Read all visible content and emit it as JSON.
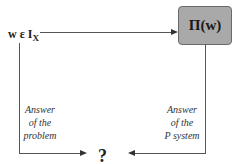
{
  "diagram": {
    "input": {
      "main": "w ε I",
      "sub": "X"
    },
    "box": {
      "label": "Π(w)"
    },
    "left_edge": {
      "lines": [
        "Answer",
        "of the",
        "problem"
      ]
    },
    "right_edge": {
      "lines": [
        "Answer",
        "of the",
        "P system"
      ]
    },
    "result": {
      "label": "?"
    }
  },
  "colors": {
    "box_fill": "#a9a9a9",
    "box_border": "#6a6a6a",
    "lines": "#555555"
  }
}
